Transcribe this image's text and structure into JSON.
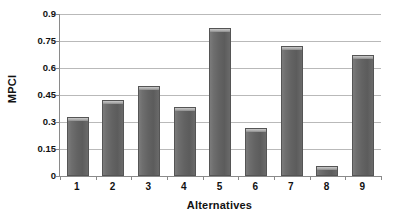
{
  "chart_data": {
    "type": "bar",
    "title": "",
    "xlabel": "Alternatives",
    "ylabel": "MPCI",
    "categories": [
      "1",
      "2",
      "3",
      "4",
      "5",
      "6",
      "7",
      "8",
      "9"
    ],
    "values": [
      0.33,
      0.42,
      0.5,
      0.385,
      0.82,
      0.265,
      0.72,
      0.055,
      0.675
    ],
    "series": [
      {
        "name": "MPCI",
        "values": [
          0.33,
          0.42,
          0.5,
          0.385,
          0.82,
          0.265,
          0.72,
          0.055,
          0.675
        ]
      }
    ],
    "ylim": [
      0,
      0.9
    ],
    "ytick_labels": [
      "0",
      "0.15",
      "0.3",
      "0.45",
      "0.6",
      "0.75",
      "0.9"
    ],
    "ytick_values": [
      0,
      0.15,
      0.3,
      0.45,
      0.6,
      0.75,
      0.9
    ],
    "grid": "horizontal",
    "legend": "none",
    "bar_color": "#646464",
    "bar_cap_color": "#b4b4b4",
    "gridline_color": "#b9b9b9",
    "axis_color": "#8a8a8a",
    "text_color": "#111111",
    "background": "#ffffff"
  }
}
